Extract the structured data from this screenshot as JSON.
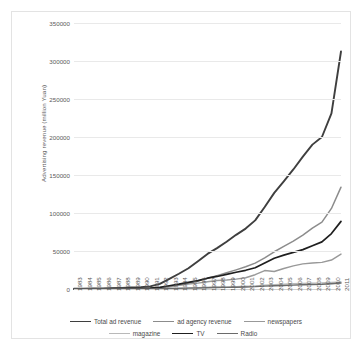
{
  "chart_data": {
    "type": "line",
    "title": "",
    "xlabel": "",
    "ylabel": "Advertising revenue (million Yuan)",
    "ylim": [
      0,
      350000
    ],
    "yticks": [
      0,
      50000,
      100000,
      150000,
      200000,
      250000,
      300000,
      350000
    ],
    "ytick_labels": [
      "0",
      "50000",
      "100000",
      "150000",
      "200000",
      "250000",
      "300000",
      "350000"
    ],
    "grid": true,
    "legend_position": "bottom",
    "categories": [
      "1983",
      "1984",
      "1985",
      "1986",
      "1987",
      "1988",
      "1989",
      "1990",
      "1991",
      "1992",
      "1993",
      "1994",
      "1995",
      "1996",
      "1997",
      "1998",
      "1999",
      "2000",
      "2001",
      "2002",
      "2003",
      "2004",
      "2005",
      "2006",
      "2007",
      "2008",
      "2009",
      "2010",
      "2011"
    ],
    "series": [
      {
        "name": "Total ad revenue",
        "color": "#3f3f3f",
        "width": 1.9,
        "values": [
          234,
          365,
          605,
          845,
          1120,
          1490,
          1996,
          2502,
          3509,
          6787,
          13409,
          20026,
          27300,
          36663,
          46196,
          53783,
          62205,
          71266,
          79488,
          90300,
          107873,
          126455,
          141600,
          157300,
          174100,
          189965,
          200000,
          231000,
          312500
        ]
      },
      {
        "name": "ad agency revenue",
        "color": "#8c8c8c",
        "width": 1.5,
        "values": [
          0,
          0,
          0,
          0,
          0,
          0,
          0,
          0,
          500,
          1200,
          2900,
          5100,
          7600,
          10500,
          14200,
          17600,
          21300,
          25200,
          29300,
          34000,
          41000,
          49000,
          56000,
          63000,
          71000,
          80000,
          88000,
          106000,
          134000
        ]
      },
      {
        "name": "newspapers",
        "color": "#999999",
        "width": 1.4,
        "values": [
          100,
          150,
          230,
          330,
          430,
          560,
          700,
          850,
          1100,
          1800,
          3700,
          5000,
          6500,
          7700,
          9600,
          11200,
          11800,
          13000,
          14800,
          18800,
          24300,
          23000,
          27000,
          30500,
          33000,
          34200,
          35000,
          38100,
          46000
        ]
      },
      {
        "name": "magazine",
        "color": "#b9b9b9",
        "width": 1.3,
        "values": [
          30,
          45,
          60,
          80,
          100,
          130,
          160,
          190,
          240,
          380,
          800,
          1100,
          1500,
          1850,
          2300,
          2600,
          2900,
          3200,
          3600,
          4100,
          5000,
          5800,
          6300,
          6900,
          7400,
          7800,
          8000,
          8600,
          9200
        ]
      },
      {
        "name": "TV",
        "color": "#1f1f1f",
        "width": 1.7,
        "values": [
          60,
          100,
          180,
          280,
          390,
          530,
          700,
          900,
          1200,
          2100,
          4300,
          6300,
          8600,
          11000,
          14200,
          16500,
          19300,
          22000,
          24600,
          27900,
          34100,
          40400,
          44600,
          48200,
          51800,
          57000,
          62000,
          73000,
          89000
        ]
      },
      {
        "name": "Radio",
        "color": "#6b6b6b",
        "width": 1.4,
        "values": [
          20,
          30,
          45,
          60,
          80,
          100,
          130,
          160,
          200,
          330,
          600,
          850,
          1100,
          1350,
          1700,
          1950,
          2150,
          2400,
          2700,
          3100,
          3800,
          4300,
          4700,
          5100,
          5500,
          5900,
          6300,
          7000,
          7900
        ]
      }
    ]
  },
  "legend": {
    "rows": [
      [
        {
          "label": "Total ad revenue",
          "color": "#3f3f3f",
          "width": 1.9
        },
        {
          "label": "ad agency revenue",
          "color": "#8c8c8c",
          "width": 1.5
        },
        {
          "label": "newspapers",
          "color": "#999999",
          "width": 1.4
        }
      ],
      [
        {
          "label": "magazine",
          "color": "#b9b9b9",
          "width": 1.3
        },
        {
          "label": "TV",
          "color": "#1f1f1f",
          "width": 1.7
        },
        {
          "label": "Radio",
          "color": "#6b6b6b",
          "width": 1.4
        }
      ]
    ]
  }
}
